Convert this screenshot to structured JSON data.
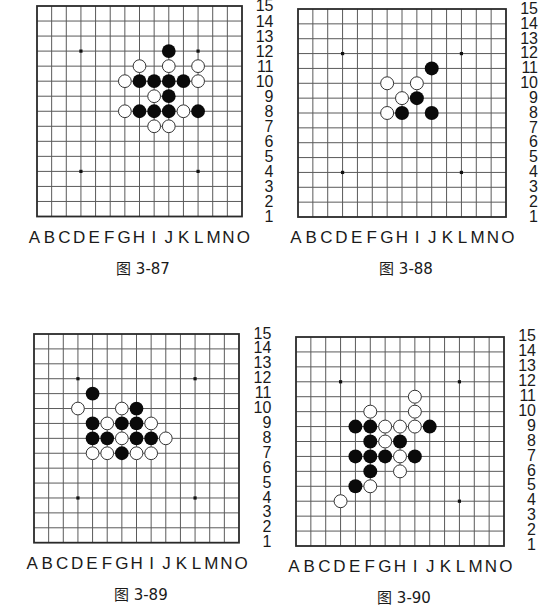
{
  "columns": [
    "A",
    "B",
    "C",
    "D",
    "E",
    "F",
    "G",
    "H",
    "I",
    "J",
    "K",
    "L",
    "M",
    "N",
    "O"
  ],
  "rows": [
    "15",
    "14",
    "13",
    "12",
    "11",
    "10",
    "9",
    "8",
    "7",
    "6",
    "5",
    "4",
    "3",
    "2",
    "1"
  ],
  "star_points": [
    [
      "D",
      12
    ],
    [
      "L",
      12
    ],
    [
      "D",
      4
    ],
    [
      "L",
      4
    ]
  ],
  "colors": {
    "grid_line": "#5a5a5a",
    "border": "#2a2a2a",
    "black_stone": "#0a0a0a",
    "white_stone": "#ffffff",
    "white_stone_outline": "#333333"
  },
  "figures": [
    {
      "caption": "图 3-87",
      "layout": {
        "left": 36.5,
        "top": 6,
        "width": 205,
        "height": 210.5
      },
      "stones": [
        {
          "col": "J",
          "row": 12,
          "color": "black"
        },
        {
          "col": "H",
          "row": 11,
          "color": "white"
        },
        {
          "col": "J",
          "row": 11,
          "color": "white"
        },
        {
          "col": "L",
          "row": 11,
          "color": "white"
        },
        {
          "col": "G",
          "row": 10,
          "color": "white"
        },
        {
          "col": "H",
          "row": 10,
          "color": "black"
        },
        {
          "col": "I",
          "row": 10,
          "color": "black"
        },
        {
          "col": "J",
          "row": 10,
          "color": "black"
        },
        {
          "col": "K",
          "row": 10,
          "color": "black"
        },
        {
          "col": "L",
          "row": 10,
          "color": "white"
        },
        {
          "col": "I",
          "row": 9,
          "color": "white"
        },
        {
          "col": "J",
          "row": 9,
          "color": "black"
        },
        {
          "col": "G",
          "row": 8,
          "color": "white"
        },
        {
          "col": "H",
          "row": 8,
          "color": "black"
        },
        {
          "col": "I",
          "row": 8,
          "color": "black"
        },
        {
          "col": "J",
          "row": 8,
          "color": "black"
        },
        {
          "col": "K",
          "row": 8,
          "color": "white"
        },
        {
          "col": "L",
          "row": 8,
          "color": "black"
        },
        {
          "col": "I",
          "row": 7,
          "color": "white"
        },
        {
          "col": "J",
          "row": 7,
          "color": "white"
        }
      ]
    },
    {
      "caption": "图 3-88",
      "layout": {
        "left": 298,
        "top": 9.3,
        "width": 208,
        "height": 208
      },
      "stones": [
        {
          "col": "J",
          "row": 11,
          "color": "black"
        },
        {
          "col": "G",
          "row": 10,
          "color": "white"
        },
        {
          "col": "I",
          "row": 10,
          "color": "white"
        },
        {
          "col": "H",
          "row": 9,
          "color": "white"
        },
        {
          "col": "I",
          "row": 9,
          "color": "black"
        },
        {
          "col": "G",
          "row": 8,
          "color": "white"
        },
        {
          "col": "H",
          "row": 8,
          "color": "black"
        },
        {
          "col": "J",
          "row": 8,
          "color": "black"
        }
      ]
    },
    {
      "caption": "图 3-89",
      "layout": {
        "left": 34.3,
        "top": 334,
        "width": 205,
        "height": 208.7
      },
      "stones": [
        {
          "col": "E",
          "row": 11,
          "color": "black"
        },
        {
          "col": "D",
          "row": 10,
          "color": "white"
        },
        {
          "col": "G",
          "row": 10,
          "color": "white"
        },
        {
          "col": "H",
          "row": 10,
          "color": "black"
        },
        {
          "col": "E",
          "row": 9,
          "color": "black"
        },
        {
          "col": "F",
          "row": 9,
          "color": "white"
        },
        {
          "col": "G",
          "row": 9,
          "color": "black"
        },
        {
          "col": "H",
          "row": 9,
          "color": "black"
        },
        {
          "col": "I",
          "row": 9,
          "color": "white"
        },
        {
          "col": "E",
          "row": 8,
          "color": "black"
        },
        {
          "col": "F",
          "row": 8,
          "color": "black"
        },
        {
          "col": "G",
          "row": 8,
          "color": "white"
        },
        {
          "col": "H",
          "row": 8,
          "color": "black"
        },
        {
          "col": "I",
          "row": 8,
          "color": "black"
        },
        {
          "col": "J",
          "row": 8,
          "color": "white"
        },
        {
          "col": "E",
          "row": 7,
          "color": "white"
        },
        {
          "col": "F",
          "row": 7,
          "color": "white"
        },
        {
          "col": "G",
          "row": 7,
          "color": "black"
        },
        {
          "col": "H",
          "row": 7,
          "color": "white"
        },
        {
          "col": "I",
          "row": 7,
          "color": "white"
        }
      ]
    },
    {
      "caption": "图 3-90",
      "layout": {
        "left": 296,
        "top": 336.7,
        "width": 208,
        "height": 209
      },
      "stones": [
        {
          "col": "I",
          "row": 11,
          "color": "white"
        },
        {
          "col": "F",
          "row": 10,
          "color": "white"
        },
        {
          "col": "I",
          "row": 10,
          "color": "white"
        },
        {
          "col": "E",
          "row": 9,
          "color": "black"
        },
        {
          "col": "F",
          "row": 9,
          "color": "black"
        },
        {
          "col": "G",
          "row": 9,
          "color": "white"
        },
        {
          "col": "H",
          "row": 9,
          "color": "white"
        },
        {
          "col": "I",
          "row": 9,
          "color": "white"
        },
        {
          "col": "J",
          "row": 9,
          "color": "black"
        },
        {
          "col": "F",
          "row": 8,
          "color": "black"
        },
        {
          "col": "G",
          "row": 8,
          "color": "white"
        },
        {
          "col": "H",
          "row": 8,
          "color": "black"
        },
        {
          "col": "E",
          "row": 7,
          "color": "black"
        },
        {
          "col": "F",
          "row": 7,
          "color": "black"
        },
        {
          "col": "G",
          "row": 7,
          "color": "black"
        },
        {
          "col": "H",
          "row": 7,
          "color": "white"
        },
        {
          "col": "I",
          "row": 7,
          "color": "black"
        },
        {
          "col": "F",
          "row": 6,
          "color": "black"
        },
        {
          "col": "H",
          "row": 6,
          "color": "white"
        },
        {
          "col": "E",
          "row": 5,
          "color": "black"
        },
        {
          "col": "F",
          "row": 5,
          "color": "white"
        },
        {
          "col": "D",
          "row": 4,
          "color": "white"
        }
      ]
    }
  ]
}
